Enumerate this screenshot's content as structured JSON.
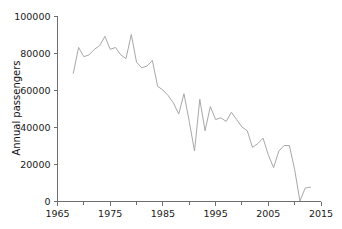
{
  "chart_data": {
    "type": "line",
    "title": "",
    "xlabel": "",
    "ylabel": "Annual passengers",
    "xlim": [
      1965,
      2015
    ],
    "ylim": [
      0,
      100000
    ],
    "grid": false,
    "legend": null,
    "x_ticks": [
      "1965",
      "1975",
      "1985",
      "1995",
      "2005",
      "2015"
    ],
    "x_tick_values": [
      1965,
      1975,
      1985,
      1995,
      2005,
      2015
    ],
    "y_ticks": [
      "0",
      "20000",
      "40000",
      "60000",
      "80000",
      "100000"
    ],
    "y_tick_values": [
      0,
      20000,
      40000,
      60000,
      80000,
      100000
    ],
    "x_minor_tick_values": [
      1970,
      1980,
      1990,
      2000,
      2010
    ],
    "series": [
      {
        "name": "Annual passengers",
        "color": "#a8a8a8",
        "x": [
          1968,
          1969,
          1970,
          1971,
          1972,
          1973,
          1974,
          1975,
          1976,
          1977,
          1978,
          1979,
          1980,
          1981,
          1982,
          1983,
          1984,
          1985,
          1986,
          1987,
          1988,
          1989,
          1990,
          1991,
          1992,
          1993,
          1994,
          1995,
          1996,
          1997,
          1998,
          1999,
          2000,
          2001,
          2002,
          2003,
          2004,
          2005,
          2006,
          2007,
          2008,
          2009,
          2010,
          2011,
          2012,
          2013
        ],
        "values": [
          69000,
          83000,
          78000,
          79000,
          82000,
          84000,
          89000,
          82000,
          83000,
          79000,
          77000,
          90000,
          75000,
          72000,
          73000,
          76000,
          62000,
          60000,
          57000,
          53000,
          47000,
          58000,
          43000,
          27000,
          55000,
          38000,
          51000,
          44000,
          45000,
          43000,
          48000,
          44000,
          40000,
          38000,
          29000,
          31000,
          34000,
          25000,
          18000,
          27000,
          30000,
          30000,
          17000,
          0,
          7000,
          7500
        ]
      }
    ]
  },
  "axis": {
    "y_title": "Annual passengers"
  }
}
